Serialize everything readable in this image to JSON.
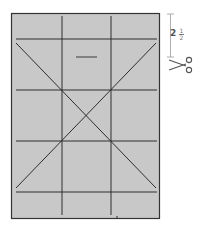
{
  "diagram": {
    "sheet_fill": "#c8c8c8",
    "line_color": "#2e2e2e",
    "measurement": {
      "whole": "2",
      "numerator": "1",
      "denominator": "2",
      "label": "2 1/2"
    },
    "cut_icon": "scissors-icon"
  }
}
